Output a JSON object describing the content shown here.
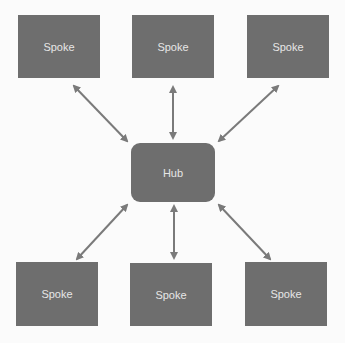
{
  "diagram": {
    "hub": {
      "label": "Hub"
    },
    "spokes": [
      {
        "label": "Spoke",
        "position": "top-left"
      },
      {
        "label": "Spoke",
        "position": "top-center"
      },
      {
        "label": "Spoke",
        "position": "top-right"
      },
      {
        "label": "Spoke",
        "position": "bottom-left"
      },
      {
        "label": "Spoke",
        "position": "bottom-center"
      },
      {
        "label": "Spoke",
        "position": "bottom-right"
      }
    ],
    "edges": "bidirectional arrows between Hub and each Spoke",
    "colors": {
      "node_fill": "#6e6e6e",
      "node_text": "#e6e6e6",
      "arrow": "#7a7a7a",
      "background": "#fbfbfb"
    }
  }
}
